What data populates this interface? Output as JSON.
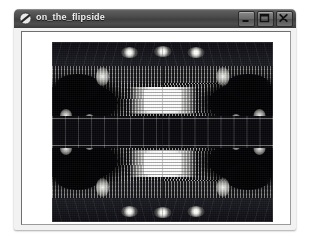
{
  "window": {
    "title": "on_the_flipside",
    "icon": "app-circle-slash-icon",
    "controls": {
      "minimize": {
        "label": "Minimize",
        "icon": "minimize-icon"
      },
      "maximize": {
        "label": "Maximize",
        "icon": "maximize-icon"
      },
      "close": {
        "label": "Close",
        "icon": "close-icon"
      }
    }
  },
  "viewer": {
    "image_alt": "Mirrored black-and-white photograph of a concert hall interior",
    "background_color": "#ffffff"
  },
  "colors": {
    "titlebar_top": "#6d6d6d",
    "titlebar_bottom": "#3a3a3a",
    "title_text": "#f0f0f0",
    "client_background": "#ffffff",
    "window_frame": "#f2f2f2",
    "photo_black": "#05050a",
    "photo_white": "#ffffff"
  }
}
